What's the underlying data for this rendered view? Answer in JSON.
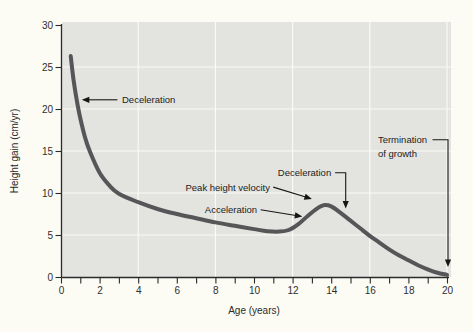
{
  "figure": {
    "colors": {
      "outer_background": "#fcfcf5",
      "plot_background": "#e3e3e0",
      "gridline": "#f9f9f6",
      "axis": "#2b2b29",
      "curve": "#565659",
      "annotation": "#161614"
    }
  },
  "chart_data": {
    "type": "line",
    "title": "",
    "xlabel": "Age (years)",
    "ylabel": "Height gain (cm/yr)",
    "xlim": [
      0,
      20
    ],
    "ylim": [
      0,
      30
    ],
    "x_major_tick_labels": [
      "0",
      "2",
      "4",
      "6",
      "8",
      "10",
      "12",
      "14",
      "16",
      "18",
      "20"
    ],
    "x_major_ticks": [
      0,
      2,
      4,
      6,
      8,
      10,
      12,
      14,
      16,
      18,
      20
    ],
    "x_minor_ticks": [
      1,
      3,
      5,
      7,
      9,
      11,
      13,
      15,
      17,
      19
    ],
    "y_ticks": [
      0,
      5,
      10,
      15,
      20,
      25,
      30
    ],
    "y_tick_labels": [
      "0",
      "5",
      "10",
      "15",
      "20",
      "25",
      "30"
    ],
    "grid": {
      "x_values": [
        4,
        8,
        12,
        16,
        20
      ],
      "y_values": [
        5,
        10,
        15,
        20,
        25
      ]
    },
    "legend": null,
    "series": [
      {
        "name": "height-gain-velocity",
        "points": [
          [
            0.5,
            26.3
          ],
          [
            0.65,
            23.5
          ],
          [
            0.8,
            21.3
          ],
          [
            1.0,
            18.9
          ],
          [
            1.25,
            16.6
          ],
          [
            1.5,
            14.9
          ],
          [
            2.0,
            12.4
          ],
          [
            2.5,
            10.9
          ],
          [
            3.0,
            9.9
          ],
          [
            4.0,
            8.9
          ],
          [
            5.0,
            8.1
          ],
          [
            6.0,
            7.5
          ],
          [
            7.0,
            7.0
          ],
          [
            8.0,
            6.5
          ],
          [
            9.0,
            6.1
          ],
          [
            10.0,
            5.7
          ],
          [
            10.7,
            5.45
          ],
          [
            11.3,
            5.4
          ],
          [
            11.8,
            5.6
          ],
          [
            12.3,
            6.3
          ],
          [
            12.8,
            7.3
          ],
          [
            13.3,
            8.2
          ],
          [
            13.6,
            8.55
          ],
          [
            14.0,
            8.4
          ],
          [
            14.5,
            7.6
          ],
          [
            15.0,
            6.7
          ],
          [
            15.5,
            5.8
          ],
          [
            16.0,
            4.9
          ],
          [
            16.5,
            4.1
          ],
          [
            17.0,
            3.3
          ],
          [
            17.5,
            2.6
          ],
          [
            18.0,
            2.0
          ],
          [
            18.5,
            1.4
          ],
          [
            19.0,
            0.9
          ],
          [
            19.5,
            0.5
          ],
          [
            20.0,
            0.25
          ]
        ]
      }
    ],
    "annotations": [
      {
        "text": "Deceleration",
        "anchor": [
          3.16,
          21.1
        ],
        "align": "start",
        "path": [
          [
            2.92,
            21.1
          ],
          [
            1.08,
            21.1
          ]
        ]
      },
      {
        "text": "Peak height velocity",
        "anchor": [
          10.83,
          10.7
        ],
        "align": "end",
        "path": [
          [
            11.0,
            10.7
          ],
          [
            13.0,
            9.3
          ]
        ]
      },
      {
        "text": "Acceleration",
        "anchor": [
          10.16,
          8.0
        ],
        "align": "end",
        "path": [
          [
            10.34,
            8.0
          ],
          [
            12.5,
            7.2
          ]
        ]
      },
      {
        "text": "Deceleration",
        "anchor": [
          14.0,
          12.4
        ],
        "align": "end",
        "path": [
          [
            14.2,
            12.4
          ],
          [
            14.75,
            12.4
          ],
          [
            14.75,
            8.15
          ]
        ]
      },
      {
        "text": "Termination\nof growth",
        "anchor": [
          16.42,
          16.35
        ],
        "align": "start",
        "path": [
          [
            19.25,
            16.35
          ],
          [
            20.05,
            16.35
          ],
          [
            20.05,
            1.2
          ]
        ]
      }
    ]
  }
}
